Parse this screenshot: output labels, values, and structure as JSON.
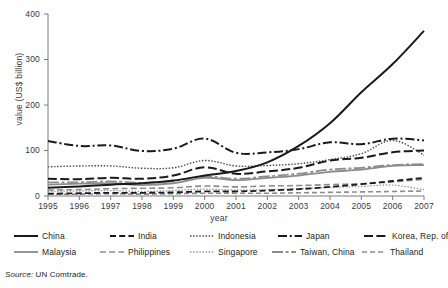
{
  "figure": {
    "source_prefix": "Source:",
    "source_text": " UN Comtrade."
  },
  "chart_data": {
    "type": "line",
    "title": "",
    "xlabel": "year",
    "ylabel": "value (US$ billion)",
    "x": [
      1995,
      1996,
      1997,
      1998,
      1999,
      2000,
      2001,
      2002,
      2003,
      2004,
      2005,
      2006,
      2007
    ],
    "xtick_labels": [
      "1995",
      "1996",
      "1997",
      "1998",
      "1999",
      "2000",
      "2001",
      "2002",
      "2003",
      "2004",
      "2005",
      "2006",
      "2007"
    ],
    "ytick_labels": [
      "0",
      "100",
      "200",
      "300",
      "400"
    ],
    "yticks": [
      0,
      100,
      200,
      300,
      400
    ],
    "ylim": [
      0,
      400
    ],
    "xlim": [
      1995,
      2007
    ],
    "grid": false,
    "legend_position": "below-axes",
    "legend_columns": 5,
    "series": [
      {
        "name": "China",
        "color": "#1a1a1a",
        "dash": "solid",
        "width": 2.0,
        "values": [
          18,
          21,
          25,
          28,
          34,
          45,
          55,
          74,
          110,
          160,
          228,
          290,
          363
        ]
      },
      {
        "name": "India",
        "color": "#1a1a1a",
        "dash": "dashed",
        "width": 1.8,
        "values": [
          5,
          6,
          7,
          7,
          8,
          10,
          10,
          12,
          15,
          20,
          26,
          33,
          40
        ]
      },
      {
        "name": "Indonesia",
        "color": "#4d4d4d",
        "dash": "dotted",
        "width": 1.4,
        "values": [
          64,
          66,
          66,
          61,
          62,
          78,
          66,
          67,
          71,
          80,
          93,
          122,
          90
        ]
      },
      {
        "name": "Japan",
        "color": "#1a1a1a",
        "dash": "dash-dot",
        "width": 2.0,
        "values": [
          121,
          110,
          111,
          99,
          104,
          126,
          95,
          96,
          103,
          118,
          114,
          126,
          122
        ]
      },
      {
        "name": "Korea, Rep. of",
        "color": "#1a1a1a",
        "dash": "long-dash",
        "width": 2.0,
        "values": [
          38,
          37,
          40,
          38,
          45,
          63,
          49,
          54,
          62,
          78,
          84,
          96,
          100
        ]
      },
      {
        "name": "Malaysia",
        "color": "#8c8c8c",
        "dash": "solid",
        "width": 1.8,
        "values": [
          25,
          27,
          28,
          24,
          28,
          40,
          35,
          40,
          45,
          53,
          58,
          66,
          68
        ]
      },
      {
        "name": "Philippines",
        "color": "#8c8c8c",
        "dash": "dashed",
        "width": 1.6,
        "values": [
          13,
          14,
          16,
          17,
          18,
          22,
          20,
          22,
          23,
          25,
          27,
          31,
          37
        ]
      },
      {
        "name": "Singapore",
        "color": "#9a9a9a",
        "dash": "dotted",
        "width": 1.3,
        "values": [
          10,
          11,
          12,
          10,
          12,
          15,
          13,
          14,
          16,
          19,
          21,
          24,
          14
        ]
      },
      {
        "name": "Taiwan, China",
        "color": "#8c8c8c",
        "dash": "solid-dash",
        "width": 1.8,
        "values": [
          30,
          30,
          32,
          29,
          33,
          43,
          38,
          43,
          49,
          58,
          62,
          68,
          70
        ]
      },
      {
        "name": "Thailand",
        "color": "#8c8c8c",
        "dash": "med-dash",
        "width": 1.6,
        "values": [
          4,
          4,
          5,
          4,
          5,
          6,
          6,
          6,
          7,
          8,
          9,
          10,
          11
        ]
      }
    ]
  }
}
